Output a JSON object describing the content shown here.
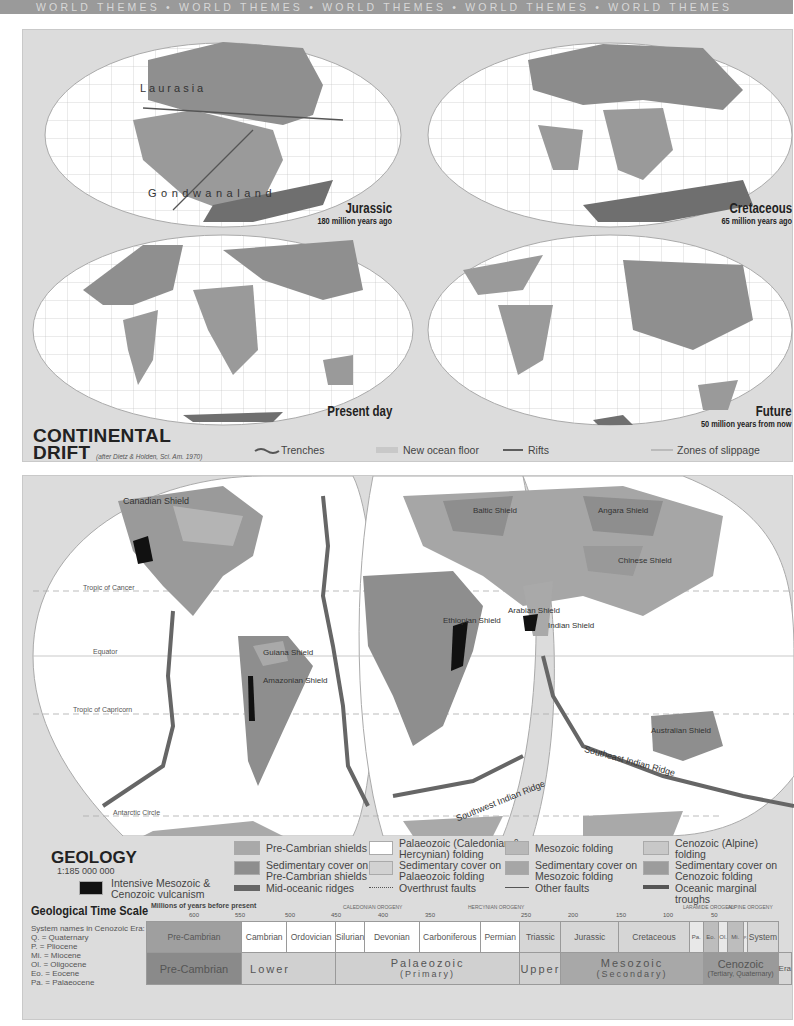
{
  "header_band": {
    "text": "WORLD THEMES  •  WORLD THEMES  •  WORLD THEMES  •  WORLD THEMES  •  WORLD THEMES"
  },
  "continental_drift": {
    "title_line1": "CONTINENTAL",
    "title_line2": "DRIFT",
    "citation": "(after Dietz & Holden, Sci. Am. 1970)",
    "maps": [
      {
        "id": "jurassic",
        "title": "Jurassic",
        "subtitle": "180 million years ago",
        "labels": [
          "Laurasia",
          "Gondwanaland"
        ]
      },
      {
        "id": "cretaceous",
        "title": "Cretaceous",
        "subtitle": "65 million years ago",
        "labels": []
      },
      {
        "id": "present",
        "title": "Present day",
        "subtitle": "",
        "labels": []
      },
      {
        "id": "future",
        "title": "Future",
        "subtitle": "50 million years from now",
        "labels": []
      }
    ],
    "legend": [
      {
        "symbol": "trench-line",
        "label": "Trenches"
      },
      {
        "symbol": "ocean-floor-swatch",
        "label": "New ocean floor"
      },
      {
        "symbol": "rift-line",
        "label": "Rifts"
      },
      {
        "symbol": "slippage-line",
        "label": "Zones of slippage"
      }
    ]
  },
  "geology": {
    "title": "GEOLOGY",
    "scale": "1:185 000 000",
    "map_labels": {
      "shields": [
        "Canadian Shield",
        "Guiana Shield",
        "Amazonian Shield",
        "Baltic Shield",
        "Angara Shield",
        "Chinese Shield",
        "Arabian Shield",
        "Ethiopian Shield",
        "Indian Shield",
        "Australian Shield"
      ],
      "mountains": [
        "Rockies",
        "Andes",
        "Appalachians",
        "Alps",
        "Atlas",
        "Urals",
        "Altai",
        "Tian Shan",
        "Kunlun Shan",
        "Hindu Kush",
        "Himalayas",
        "Zagros",
        "Great Rift Valley",
        "Great Dividing Range"
      ],
      "ridges": [
        "Mid-Atlantic Ridge",
        "East Pacific Rise",
        "Pacific-Antarctic Ridge",
        "Mid-Indian Ridge",
        "Southwest Indian Ridge",
        "Southeast Indian Ridge"
      ],
      "trenches": [
        "P.Rico Trench",
        "Peru-Chile Trench",
        "Aleutian Trench",
        "Kuril Trench",
        "Mariana Trench",
        "Philippine Trench",
        "Java Trench",
        "Tonga Trench"
      ],
      "parallels": [
        "Tropic of Cancer",
        "Equator",
        "Tropic of Capricorn",
        "Antarctic Circle"
      ]
    },
    "legend": [
      {
        "label": "Pre-Cambrian shields",
        "color": "#a9a9a9"
      },
      {
        "label": "Sedimentary cover on Pre-Cambrian shields",
        "color": "#8e8e8e"
      },
      {
        "label": "Mid-oceanic ridges",
        "color": "#666666"
      },
      {
        "label": "Palaeozoic (Caledonian & Hercynian) folding",
        "color": "#ffffff"
      },
      {
        "label": "Sedimentary cover on Palaeozoic folding",
        "color": "#d2d2d2"
      },
      {
        "label": "Overthrust faults",
        "color": "#555555"
      },
      {
        "label": "Mesozoic folding",
        "color": "#b8b8b8"
      },
      {
        "label": "Sedimentary cover on Mesozoic folding",
        "color": "#a6a6a6"
      },
      {
        "label": "Other faults",
        "color": "#555555"
      },
      {
        "label": "Cenozoic (Alpine) folding",
        "color": "#c8c8c8"
      },
      {
        "label": "Sedimentary cover on Cenozoic folding",
        "color": "#9c9c9c"
      },
      {
        "label": "Oceanic marginal troughs",
        "color": "#555555"
      },
      {
        "label": "Intensive Mesozoic & Cenozoic vulcanism",
        "color": "#111111"
      }
    ]
  },
  "time_scale": {
    "title": "Geological Time Scale",
    "axis_label": "Millions of years before present",
    "ticks": [
      "600",
      "550",
      "500",
      "450",
      "400",
      "350",
      "250",
      "200",
      "150",
      "100",
      "50"
    ],
    "orogenies": [
      "CALEDONIAN OROGENY",
      "HERCYNIAN OROGENY",
      "LARAMIDE OROGENY",
      "ALPINE OROGENY"
    ],
    "notes_title": "System names in Cenozoic Era:",
    "notes": [
      "Q.  = Quaternary",
      "P.  = Pliocene",
      "Mi. = Miocene",
      "Ol. = Oligocene",
      "Eo. = Eocene",
      "Pa. = Palaeocene"
    ],
    "systems": [
      "Pre-Cambrian",
      "Cambrian",
      "Ordovician",
      "Silurian",
      "Devonian",
      "Carboniferous",
      "Permian",
      "Triassic",
      "Jurassic",
      "Cretaceous",
      "Pa.",
      "Eo.",
      "Ol.",
      "Mi.",
      "P.",
      "Q.",
      "System"
    ],
    "eras": [
      "Pre-Cambrian",
      "Lower",
      "Palaeozoic",
      "(Primary)",
      "Upper",
      "Mesozoic",
      "(Secondary)",
      "Cenozoic",
      "(Tertiary, Quaternary)",
      "Era"
    ]
  }
}
